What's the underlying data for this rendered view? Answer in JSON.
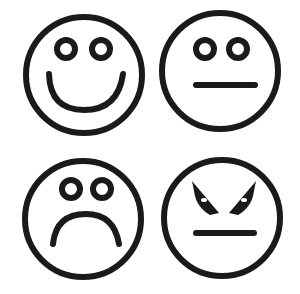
{
  "faces": [
    {
      "name": "happy",
      "label": "Happy face"
    },
    {
      "name": "neutral",
      "label": "Neutral face"
    },
    {
      "name": "sad",
      "label": "Sad face"
    },
    {
      "name": "angry",
      "label": "Angry face"
    }
  ],
  "colors": {
    "stroke": "#1a1a1a",
    "background": "#ffffff"
  }
}
